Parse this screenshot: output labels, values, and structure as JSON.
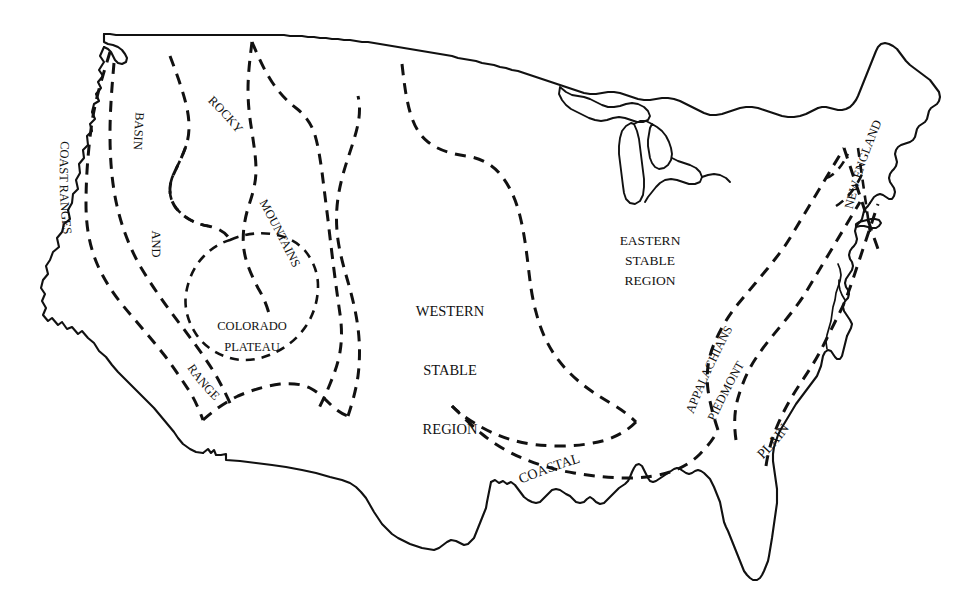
{
  "figure": {
    "kind": "line-drawing-map",
    "background_color": "#ffffff",
    "ink_color": "#111111",
    "width": 974,
    "height": 615
  },
  "legend_note": {
    "solid_line_meaning": "national and state coastline / border outline",
    "dashed_line_meaning": "province boundary"
  },
  "labels": {
    "coast_ranges": "COAST RANGES",
    "basin_and_range": "BASIN AND RANGE",
    "basin": "BASIN",
    "and": "AND",
    "range": "RANGE",
    "rocky_mountains": "ROCKY MOUNTAINS",
    "rocky": "ROCKY",
    "mountains": "MOUNTAINS",
    "colorado": "COLORADO",
    "plateau": "PLATEAU",
    "western": "WESTERN",
    "stable": "STABLE",
    "region": "REGION",
    "eastern": "EASTERN",
    "eastern_stable": "STABLE",
    "eastern_region": "REGION",
    "appalachians": "APPALACHIANS",
    "piedmont": "PIEDMONT",
    "coastal": "COASTAL",
    "plain": "PLAIN",
    "new_england": "NEW ENGLAND"
  },
  "regions": [
    {
      "id": "coast-ranges",
      "name": "COAST RANGES",
      "position": "far west, Pacific margin"
    },
    {
      "id": "basin-and-range",
      "name": "BASIN AND RANGE",
      "position": "interior west"
    },
    {
      "id": "rocky-mountains",
      "name": "ROCKY MOUNTAINS",
      "position": "northern and central Rockies"
    },
    {
      "id": "colorado-plateau",
      "name": "COLORADO PLATEAU",
      "position": "Four Corners"
    },
    {
      "id": "western-stable",
      "name": "WESTERN STABLE REGION",
      "position": "Great Plains / midcontinent"
    },
    {
      "id": "eastern-stable",
      "name": "EASTERN STABLE REGION",
      "position": "Great Lakes / Ohio valley"
    },
    {
      "id": "appalachians",
      "name": "APPALACHIANS",
      "position": "eastern highlands"
    },
    {
      "id": "piedmont",
      "name": "PIEDMONT",
      "position": "east of Appalachians"
    },
    {
      "id": "coastal-plain",
      "name": "COASTAL PLAIN",
      "position": "Gulf and Atlantic margin"
    },
    {
      "id": "new-england",
      "name": "NEW ENGLAND",
      "position": "northeast corner"
    }
  ]
}
